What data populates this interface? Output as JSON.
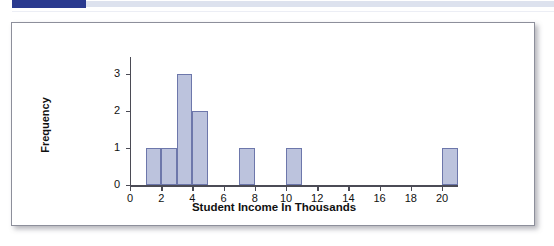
{
  "decor": {
    "accent_color": "#2a3a8f",
    "rule_color": "#dde2ee"
  },
  "panel": {
    "background": "#ffffff",
    "border_color": "#8d8f9b"
  },
  "chart_data": {
    "type": "bar",
    "title": "",
    "subtitle": "",
    "xlabel": "Student Income In Thousands",
    "ylabel": "Frequency",
    "xlim": [
      0,
      21
    ],
    "ylim": [
      0,
      3.6
    ],
    "grid": false,
    "legend": null,
    "bar_fill": "#bcc3dd",
    "bar_stroke": "#6d77ab",
    "axis_color": "#4b4b55",
    "x_ticks": [
      "0",
      "2",
      "4",
      "6",
      "8",
      "10",
      "12",
      "14",
      "16",
      "18",
      "20"
    ],
    "x_tick_values": [
      0,
      2,
      4,
      6,
      8,
      10,
      12,
      14,
      16,
      18,
      20
    ],
    "y_ticks": [
      "0",
      "1",
      "2",
      "3"
    ],
    "y_tick_values": [
      0,
      1,
      2,
      3
    ],
    "bin_width": 1,
    "bins": [
      {
        "x0": 1,
        "x1": 2,
        "frequency": 1
      },
      {
        "x0": 2,
        "x1": 3,
        "frequency": 1
      },
      {
        "x0": 3,
        "x1": 4,
        "frequency": 3
      },
      {
        "x0": 4,
        "x1": 5,
        "frequency": 2
      },
      {
        "x0": 7,
        "x1": 8,
        "frequency": 1
      },
      {
        "x0": 10,
        "x1": 11,
        "frequency": 1
      },
      {
        "x0": 20,
        "x1": 21,
        "frequency": 1
      }
    ],
    "categories": [
      "1-2",
      "2-3",
      "3-4",
      "4-5",
      "7-8",
      "10-11",
      "20-21"
    ],
    "values": [
      1,
      1,
      3,
      2,
      1,
      1,
      1
    ]
  }
}
